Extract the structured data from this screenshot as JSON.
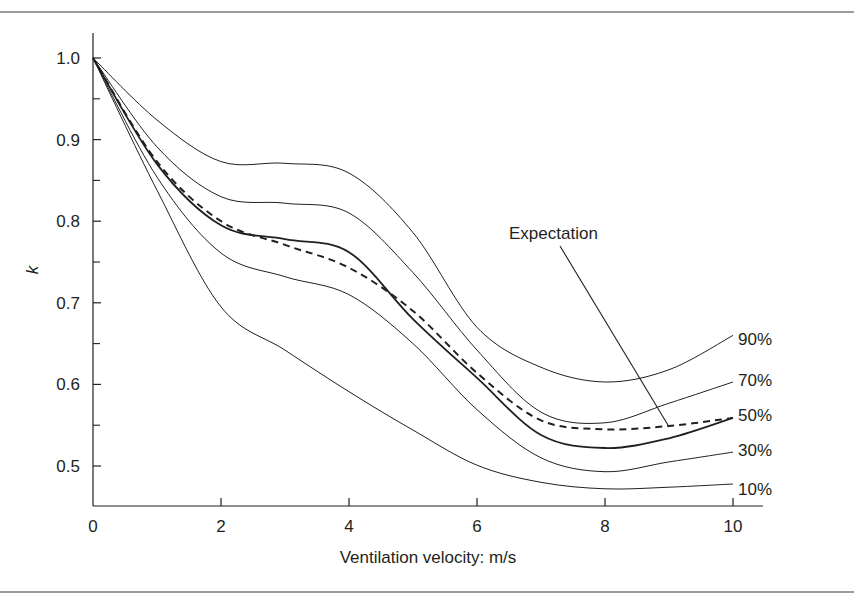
{
  "chart_data": {
    "type": "line",
    "title": "",
    "xlabel": "Ventilation velocity: m/s",
    "ylabel": "k",
    "xlim": [
      0,
      10.5
    ],
    "ylim": [
      0.45,
      1.03
    ],
    "grid": false,
    "legend_position": "inline-right",
    "x_ticks": [
      0,
      2,
      4,
      6,
      8,
      10
    ],
    "x_tick_labels": [
      "0",
      "2",
      "4",
      "6",
      "8",
      "10"
    ],
    "y_ticks": [
      0.5,
      0.6,
      0.7,
      0.8,
      0.9,
      1.0
    ],
    "y_tick_labels": [
      "0.5",
      "0.6",
      "0.7",
      "0.8",
      "0.9",
      "1.0"
    ],
    "y_minor_ticks": [
      0.55,
      0.65,
      0.75,
      0.85,
      0.95
    ],
    "x": [
      0,
      1,
      2,
      3,
      4,
      5,
      6,
      7,
      8,
      9,
      10
    ],
    "series": [
      {
        "name": "90%",
        "style": "solid",
        "width": 1,
        "values": [
          1.0,
          0.924,
          0.873,
          0.871,
          0.859,
          0.786,
          0.67,
          0.621,
          0.603,
          0.618,
          0.66
        ]
      },
      {
        "name": "70%",
        "style": "solid",
        "width": 1,
        "values": [
          1.0,
          0.891,
          0.83,
          0.822,
          0.81,
          0.737,
          0.642,
          0.566,
          0.553,
          0.577,
          0.603
        ]
      },
      {
        "name": "50%",
        "style": "solid",
        "width": 1.8,
        "values": [
          1.0,
          0.87,
          0.795,
          0.778,
          0.762,
          0.68,
          0.608,
          0.538,
          0.522,
          0.534,
          0.559
        ]
      },
      {
        "name": "30%",
        "style": "solid",
        "width": 1,
        "values": [
          1.0,
          0.854,
          0.761,
          0.732,
          0.71,
          0.65,
          0.569,
          0.51,
          0.493,
          0.505,
          0.517
        ]
      },
      {
        "name": "10%",
        "style": "solid",
        "width": 1,
        "values": [
          1.0,
          0.838,
          0.695,
          0.642,
          0.591,
          0.544,
          0.501,
          0.48,
          0.472,
          0.474,
          0.478
        ]
      },
      {
        "name": "Expectation",
        "style": "dashed",
        "width": 2,
        "values": [
          1.0,
          0.873,
          0.8,
          0.771,
          0.743,
          0.69,
          0.614,
          0.556,
          0.545,
          0.549,
          0.559
        ]
      }
    ],
    "annotations": [
      {
        "text": "Expectation",
        "label_at": [
          7.05,
          0.795
        ],
        "arrow_to": [
          9.0,
          0.548
        ]
      }
    ],
    "inline_labels": [
      "90%",
      "70%",
      "50%",
      "30%",
      "10%"
    ]
  }
}
